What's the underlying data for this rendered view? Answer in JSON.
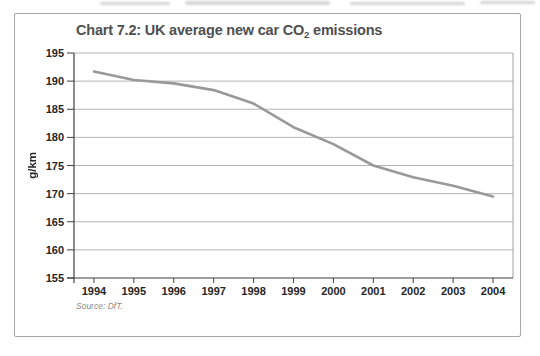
{
  "page": {
    "background": "#ffffff"
  },
  "card": {
    "border_color": "#a6a6a6",
    "background": "#ffffff"
  },
  "title": {
    "prefix": "Chart 7.2: UK average new car CO",
    "subscript": "2",
    "suffix": " emissions",
    "color": "#4f4f4f"
  },
  "source": {
    "text": "Source: DfT.",
    "color": "#8c8c8c"
  },
  "chart_data": {
    "type": "line",
    "title": "Chart 7.2: UK average new car CO2 emissions",
    "categories": [
      "1994",
      "1995",
      "1996",
      "1997",
      "1998",
      "1999",
      "2000",
      "2001",
      "2002",
      "2003",
      "2004"
    ],
    "series": [
      {
        "name": "UK average new car CO2 emissions (g/km)",
        "values": [
          191.7,
          190.2,
          189.6,
          188.4,
          186.0,
          181.8,
          178.8,
          175.0,
          172.9,
          171.4,
          169.5
        ]
      }
    ],
    "xlabel": "",
    "ylabel": "g/km",
    "ylim": [
      155,
      195
    ],
    "yticks": [
      155,
      160,
      165,
      170,
      175,
      180,
      185,
      190,
      195
    ],
    "grid": "horizontal-only",
    "legend": "none",
    "colors": {
      "line": "#999999",
      "gridline": "#b5b5b5",
      "axis": "#3f3f3f",
      "frame": "#a0a0a0",
      "tick_label": "#262626"
    }
  }
}
